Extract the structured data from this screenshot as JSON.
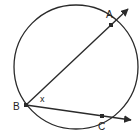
{
  "diagram": {
    "type": "circle-inscribed-angle",
    "circle": {
      "cx": 76,
      "cy": 67,
      "r": 62
    },
    "stroke_color": "#2a2a2a",
    "points": {
      "A": {
        "label": "A",
        "x": 111,
        "y": 25
      },
      "B": {
        "label": "B",
        "x": 26,
        "y": 105
      },
      "C": {
        "label": "C",
        "x": 102,
        "y": 116
      }
    },
    "rays": [
      {
        "from": "B",
        "through": "A",
        "to": {
          "x": 128,
          "y": 9
        }
      },
      {
        "from": "B",
        "through": "C",
        "to": {
          "x": 131,
          "y": 120
        }
      }
    ],
    "angle_label": "x"
  }
}
